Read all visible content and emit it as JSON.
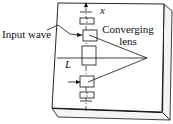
{
  "diagram": {
    "labels": {
      "input_wave": "Input wave",
      "lens_line1": "Converging",
      "lens_line2": "lens",
      "axis": "x",
      "length": "L"
    },
    "colors": {
      "stroke": "#111111",
      "plate_face": "#ffffff",
      "plate_edge": "#1a1a1a",
      "background": "#ffffff"
    }
  }
}
